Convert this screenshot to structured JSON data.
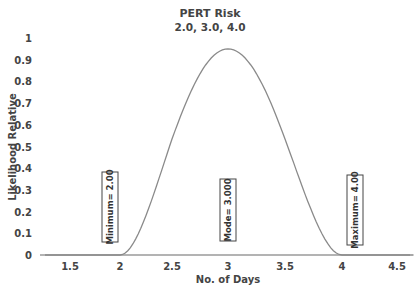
{
  "chart_data": {
    "type": "line",
    "title": "PERT Risk",
    "subtitle": "2.0, 3.0, 4.0",
    "xlabel": "No. of Days",
    "ylabel": "Likelihood Relative",
    "xlim": [
      1.25,
      4.65
    ],
    "ylim": [
      0,
      1
    ],
    "x_ticks": [
      1.5,
      2,
      2.5,
      3,
      3.5,
      4,
      4.5
    ],
    "x_tick_labels": [
      "1.5",
      "2",
      "2.5",
      "3",
      "3.5",
      "4",
      "4.5"
    ],
    "y_ticks": [
      0,
      0.1,
      0.2,
      0.3,
      0.4,
      0.5,
      0.6,
      0.7,
      0.8,
      0.9,
      1
    ],
    "y_tick_labels": [
      "0",
      "0.1",
      "0.2",
      "0.3",
      "0.4",
      "0.5",
      "0.6",
      "0.7",
      "0.8",
      "0.9",
      "1"
    ],
    "grid": false,
    "legend": null,
    "series": [
      {
        "name": "PERT Risk",
        "color": "#8a8a8a",
        "x": [
          1.25,
          2.0,
          2.1,
          2.2,
          2.3,
          2.4,
          2.5,
          2.6,
          2.7,
          2.8,
          2.9,
          3.0,
          3.1,
          3.2,
          3.3,
          3.4,
          3.5,
          3.6,
          3.7,
          3.8,
          3.9,
          4.0,
          4.65
        ],
        "y": [
          0,
          0,
          0.18,
          0.34,
          0.48,
          0.6,
          0.7,
          0.79,
          0.86,
          0.91,
          0.94,
          0.95,
          0.94,
          0.91,
          0.86,
          0.79,
          0.7,
          0.6,
          0.48,
          0.34,
          0.18,
          0,
          0
        ]
      }
    ],
    "annotations": [
      {
        "text": "Minimum= 2.00",
        "x": 1.88,
        "y_center": 0.35
      },
      {
        "text": "Mode= 3.000",
        "x": 3.0,
        "y_center": 0.27
      },
      {
        "text": "Maximum= 4.00",
        "x": 4.12,
        "y_center": 0.31
      }
    ]
  }
}
